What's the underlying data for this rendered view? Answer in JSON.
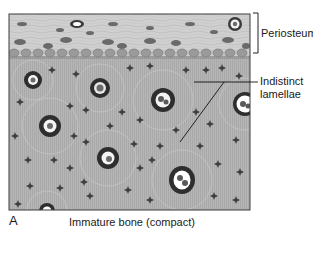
{
  "figure": {
    "panel_letter": "A",
    "caption": "Immature bone (compact)",
    "labels": {
      "periosteum": "Periosteum",
      "lamellae_line1": "Indistinct",
      "lamellae_line2": "lamellae"
    },
    "colors": {
      "bone_matrix": "#b4b4b4",
      "periosteum": "#cfcfcf",
      "cell_dark": "#3a3a3a",
      "frame": "#3c3c3c",
      "canal_white": "#ffffff"
    },
    "osteons": [
      {
        "cx": 33,
        "cy": 80,
        "r": 9
      },
      {
        "cx": 100,
        "cy": 88,
        "r": 10
      },
      {
        "cx": 163,
        "cy": 100,
        "r": 12
      },
      {
        "cx": 245,
        "cy": 104,
        "r": 12
      },
      {
        "cx": 50,
        "cy": 126,
        "r": 11
      },
      {
        "cx": 108,
        "cy": 158,
        "r": 11
      },
      {
        "cx": 182,
        "cy": 180,
        "r": 13
      },
      {
        "cx": 47,
        "cy": 211,
        "r": 8
      }
    ]
  }
}
